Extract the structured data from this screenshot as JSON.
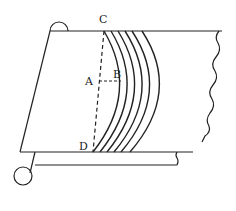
{
  "diagram": {
    "colors": {
      "line": "#222222",
      "background": "#ffffff"
    },
    "labels": {
      "C": "C",
      "A": "A",
      "B": "B",
      "D": "D"
    },
    "arc_count": 6
  }
}
